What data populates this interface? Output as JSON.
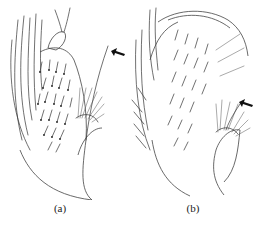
{
  "figure": {
    "panels": [
      {
        "id": "a",
        "label": "(a)",
        "arrow": "arrow-pointing-to-long-seta"
      },
      {
        "id": "b",
        "label": "(b)",
        "arrow": "arrow-pointing-to-long-seta"
      }
    ],
    "colors": {
      "ink": "#333333",
      "background": "#ffffff"
    }
  }
}
